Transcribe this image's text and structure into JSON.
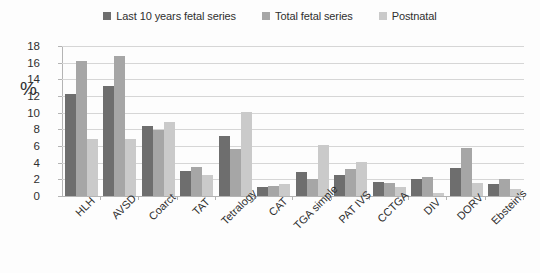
{
  "chart_data": {
    "type": "bar",
    "title": "",
    "xlabel": "",
    "ylabel": "%",
    "ylim": [
      0,
      18
    ],
    "ytick_step": 2,
    "yticks": [
      18,
      16,
      14,
      12,
      10,
      8,
      6,
      4,
      2,
      0
    ],
    "grid": true,
    "legend_position": "top-center",
    "categories": [
      "HLH",
      "AVSD",
      "Coarct",
      "TAT",
      "Tetralogy",
      "CAT",
      "TGA simple",
      "PAT IVS",
      "CCTGA",
      "DIV",
      "DORV",
      "Ebstein's"
    ],
    "series": [
      {
        "name": "Last 10 years fetal series",
        "color": "#6e6e6e",
        "values": [
          12.3,
          13.2,
          8.4,
          3.0,
          7.2,
          1.1,
          2.9,
          2.5,
          1.7,
          2.1,
          3.4,
          1.4
        ]
      },
      {
        "name": "Total fetal series",
        "color": "#a6a6a6",
        "values": [
          16.2,
          16.8,
          7.9,
          3.5,
          5.6,
          1.2,
          2.0,
          3.3,
          1.6,
          2.3,
          5.8,
          2.1
        ]
      },
      {
        "name": "Postnatal",
        "color": "#cacaca",
        "values": [
          6.9,
          6.9,
          8.9,
          2.5,
          10.1,
          1.5,
          6.1,
          4.1,
          1.1,
          0.4,
          1.6,
          0.9
        ]
      }
    ]
  }
}
